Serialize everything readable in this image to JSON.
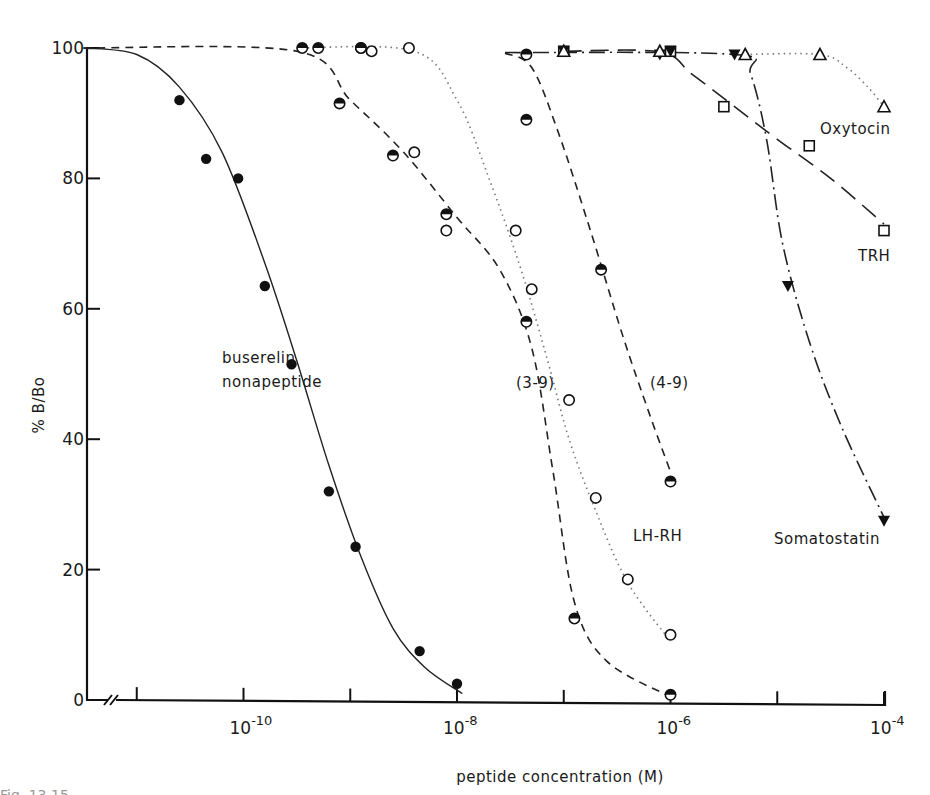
{
  "figure": {
    "caption_partial": "Fig. 13.15"
  },
  "chart_data": {
    "type": "line",
    "title": "",
    "xlabel": "peptide concentration (M)",
    "ylabel": "% B/Bo",
    "x_scale": "log10",
    "xlim": [
      -11.5,
      -4
    ],
    "ylim": [
      0,
      100
    ],
    "x_axis_break": true,
    "y_ticks": [
      0,
      20,
      40,
      60,
      80,
      100
    ],
    "x_ticks": [
      -11,
      -10,
      -9,
      -8,
      -7,
      -6,
      -5,
      -4
    ],
    "x_tick_labels": [
      {
        "at": -10,
        "base": "10",
        "exp": "-10"
      },
      {
        "at": -8,
        "base": "10",
        "exp": "-8"
      },
      {
        "at": -6,
        "base": "10",
        "exp": "-6"
      },
      {
        "at": -4,
        "base": "10",
        "exp": "-4"
      }
    ],
    "grid": false,
    "legend": "inline labels",
    "series": [
      {
        "name": "buserelin nonapeptide",
        "label_lines": [
          "buserelin",
          "nonapeptide"
        ],
        "marker": "filled-circle",
        "line": "solid",
        "points": [
          [
            -10.6,
            92
          ],
          [
            -10.35,
            83
          ],
          [
            -10.05,
            80
          ],
          [
            -9.8,
            63.5
          ],
          [
            -9.55,
            51.5
          ],
          [
            -9.2,
            32
          ],
          [
            -8.95,
            23.5
          ],
          [
            -8.35,
            7.5
          ],
          [
            -8.0,
            2.5
          ]
        ],
        "curve": [
          [
            -11.5,
            100
          ],
          [
            -11.0,
            99
          ],
          [
            -10.6,
            94
          ],
          [
            -10.2,
            84
          ],
          [
            -9.8,
            67
          ],
          [
            -9.5,
            52
          ],
          [
            -9.2,
            36
          ],
          [
            -8.9,
            22
          ],
          [
            -8.6,
            11
          ],
          [
            -8.3,
            5
          ],
          [
            -7.95,
            1
          ]
        ]
      },
      {
        "name": "(3-9)",
        "label_lines": [
          "(3-9)"
        ],
        "marker": "half-filled-circle",
        "line": "dashed",
        "points": [
          [
            -9.45,
            100
          ],
          [
            -9.3,
            100
          ],
          [
            -8.9,
            100
          ],
          [
            -8.9,
            100
          ],
          [
            -9.1,
            91.5
          ],
          [
            -8.6,
            83.5
          ],
          [
            -8.1,
            74.5
          ],
          [
            -7.35,
            58
          ],
          [
            -6.9,
            12.5
          ],
          [
            -6.0,
            0.8
          ]
        ],
        "curve": [
          [
            -11.5,
            100
          ],
          [
            -9.5,
            99.5
          ],
          [
            -9.0,
            92
          ],
          [
            -8.5,
            84
          ],
          [
            -8.0,
            74
          ],
          [
            -7.6,
            66
          ],
          [
            -7.3,
            54
          ],
          [
            -7.1,
            35
          ],
          [
            -6.9,
            15
          ],
          [
            -6.6,
            6
          ],
          [
            -6.0,
            0.5
          ]
        ]
      },
      {
        "name": "LH-RH",
        "label_lines": [
          "LH-RH"
        ],
        "marker": "open-circle",
        "line": "dotted",
        "points": [
          [
            -8.45,
            100
          ],
          [
            -8.8,
            99.5
          ],
          [
            -8.4,
            84
          ],
          [
            -8.1,
            72
          ],
          [
            -7.45,
            72
          ],
          [
            -7.3,
            63
          ],
          [
            -6.95,
            46
          ],
          [
            -6.7,
            31
          ],
          [
            -6.4,
            18.5
          ],
          [
            -6.0,
            10
          ]
        ],
        "curve": [
          [
            -9.5,
            100
          ],
          [
            -8.4,
            99.5
          ],
          [
            -8.0,
            92
          ],
          [
            -7.7,
            80
          ],
          [
            -7.4,
            66
          ],
          [
            -7.15,
            52
          ],
          [
            -6.95,
            40
          ],
          [
            -6.7,
            29
          ],
          [
            -6.4,
            18
          ],
          [
            -6.0,
            9
          ]
        ]
      },
      {
        "name": "(4-9)",
        "label_lines": [
          "(4-9)"
        ],
        "marker": "half-filled-circle",
        "line": "dashed",
        "points": [
          [
            -7.35,
            99
          ],
          [
            -7.35,
            89
          ],
          [
            -6.65,
            66
          ],
          [
            -6.0,
            33.5
          ]
        ],
        "curve": [
          [
            -7.55,
            99.2
          ],
          [
            -7.3,
            97
          ],
          [
            -7.05,
            87
          ],
          [
            -6.75,
            72
          ],
          [
            -6.45,
            56
          ],
          [
            -6.2,
            44
          ],
          [
            -6.0,
            35
          ]
        ]
      },
      {
        "name": "TRH",
        "label_lines": [
          "TRH"
        ],
        "marker": "open-square",
        "line": "long-dashed",
        "points": [
          [
            -7.0,
            99.5
          ],
          [
            -6.0,
            99.5
          ],
          [
            -5.5,
            91
          ],
          [
            -4.7,
            85
          ],
          [
            -4.0,
            72
          ]
        ],
        "curve": [
          [
            -7.0,
            99.5
          ],
          [
            -6.1,
            99.4
          ],
          [
            -5.8,
            96
          ],
          [
            -5.4,
            91
          ],
          [
            -5.0,
            86
          ],
          [
            -4.5,
            80
          ],
          [
            -4.0,
            73
          ]
        ]
      },
      {
        "name": "Somatostatin",
        "label_lines": [
          "Somatostatin"
        ],
        "marker": "filled-triangle-down",
        "line": "dash-dot",
        "points": [
          [
            -7.0,
            99.5
          ],
          [
            -6.0,
            99.5
          ],
          [
            -4.0,
            27.5
          ],
          [
            -4.9,
            63.5
          ],
          [
            -5.4,
            99
          ],
          [
            -6.1,
            99
          ]
        ],
        "curve": [
          [
            -7.55,
            99.3
          ],
          [
            -5.4,
            99
          ],
          [
            -5.25,
            96
          ],
          [
            -5.1,
            86
          ],
          [
            -4.95,
            70
          ],
          [
            -4.7,
            55
          ],
          [
            -4.4,
            42
          ],
          [
            -4.0,
            28
          ]
        ]
      },
      {
        "name": "Oxytocin",
        "label_lines": [
          "Oxytocin"
        ],
        "marker": "open-triangle-up",
        "line": "dotted",
        "points": [
          [
            -7.0,
            99.5
          ],
          [
            -6.1,
            99.5
          ],
          [
            -5.3,
            99
          ],
          [
            -4.6,
            99
          ],
          [
            -4.0,
            91
          ]
        ],
        "curve": [
          [
            -5.3,
            99
          ],
          [
            -4.6,
            99
          ],
          [
            -4.35,
            97
          ],
          [
            -4.15,
            94
          ],
          [
            -4.0,
            91
          ]
        ]
      }
    ],
    "annotations": [
      {
        "text": "buserelin",
        "at_px": [
          222,
          363
        ]
      },
      {
        "text": "nonapeptide",
        "at_px": [
          222,
          387
        ]
      },
      {
        "text": "(3-9)",
        "at_px": [
          516,
          388
        ]
      },
      {
        "text": "(4-9)",
        "at_px": [
          650,
          388
        ]
      },
      {
        "text": "LH-RH",
        "at_px": [
          633,
          541
        ]
      },
      {
        "text": "Somatostatin",
        "at_px": [
          774,
          544
        ]
      },
      {
        "text": "Oxytocin",
        "at_px": [
          820,
          134
        ]
      },
      {
        "text": "TRH",
        "at_px": [
          858,
          261
        ]
      }
    ]
  }
}
